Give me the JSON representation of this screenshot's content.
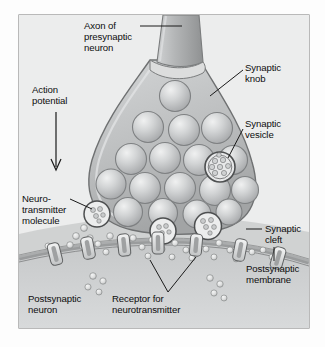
{
  "figure": {
    "frame": {
      "border_color": "#8d8d8d",
      "background_color": "#eceded"
    },
    "colors": {
      "axon_fill": "#a9abad",
      "knob_fill": "#bcbebf",
      "knob_outline": "#6f7172",
      "vesicle_fill": "#c9cbcc",
      "vesicle_outline": "#7e8082",
      "cleft_fill": "#b4b6b7",
      "postsynaptic_fill": "#cdcfd0",
      "membrane_band": "#9a9c9d",
      "receptor_fill": "#e2e3e4",
      "molecule_fill": "#e4e5e6",
      "label_text": "#0d0d0d",
      "leader_line": "#1a1a1a"
    },
    "labels": [
      {
        "id": "axon-of-presynaptic-neuron",
        "text": "Axon of\npresynaptic\nneuron",
        "x": 84,
        "y": 20
      },
      {
        "id": "action-potential",
        "text": "Action\npotential",
        "x": 32,
        "y": 84
      },
      {
        "id": "synaptic-knob",
        "text": "Synaptic\nknob",
        "x": 245,
        "y": 62
      },
      {
        "id": "synaptic-vesicle",
        "text": "Synaptic\nvesicle",
        "x": 245,
        "y": 118
      },
      {
        "id": "neurotransmitter-molecule",
        "text": "Neuro-\ntransmitter\nmolecule",
        "x": 22,
        "y": 193
      },
      {
        "id": "synaptic-cleft",
        "text": "Synaptic\ncleft",
        "x": 265,
        "y": 223
      },
      {
        "id": "postsynaptic-membrane",
        "text": "Postsynaptic\nmembrane",
        "x": 246,
        "y": 263
      },
      {
        "id": "postsynaptic-neuron",
        "text": "Postsynaptic\nneuron",
        "x": 28,
        "y": 293
      },
      {
        "id": "receptor-for-neurotransmitter",
        "text": "Receptor for\nneurotransmitter",
        "x": 112,
        "y": 293
      }
    ],
    "structures": {
      "axon": "Axon of presynaptic neuron",
      "knob": "Synaptic knob",
      "vesicles": "Synaptic vesicles",
      "cleft": "Synaptic cleft",
      "postsynaptic_membrane": "Postsynaptic membrane",
      "receptors": "Receptors for neurotransmitter",
      "molecules": "Neurotransmitter molecules"
    }
  }
}
